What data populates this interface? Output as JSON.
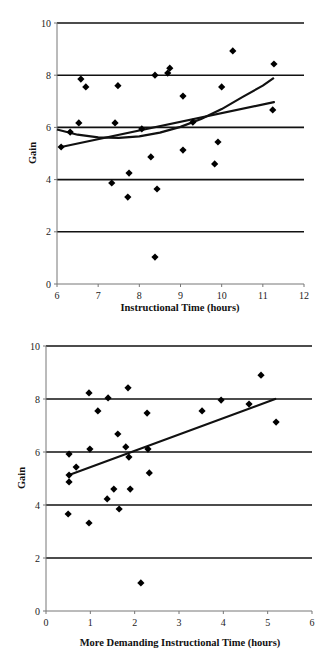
{
  "chart_data": [
    {
      "type": "scatter",
      "title": "",
      "xlabel": "Instructional Time (hours)",
      "ylabel": "Gain",
      "xlim": [
        6,
        12
      ],
      "ylim": [
        0,
        10
      ],
      "xticks": [
        6,
        7,
        8,
        9,
        10,
        11,
        12
      ],
      "yticks": [
        0,
        2,
        4,
        6,
        8,
        10
      ],
      "grid": "horizontal",
      "legend": "none",
      "marker": "diamond",
      "points": [
        {
          "x": 6.1,
          "y": 5.25
        },
        {
          "x": 6.32,
          "y": 5.82
        },
        {
          "x": 6.53,
          "y": 6.17
        },
        {
          "x": 6.58,
          "y": 7.85
        },
        {
          "x": 6.7,
          "y": 7.55
        },
        {
          "x": 7.33,
          "y": 3.87
        },
        {
          "x": 7.41,
          "y": 6.17
        },
        {
          "x": 7.48,
          "y": 7.6
        },
        {
          "x": 7.72,
          "y": 3.33
        },
        {
          "x": 7.75,
          "y": 4.25
        },
        {
          "x": 8.06,
          "y": 5.94
        },
        {
          "x": 8.28,
          "y": 4.87
        },
        {
          "x": 8.38,
          "y": 8.0
        },
        {
          "x": 8.38,
          "y": 1.03
        },
        {
          "x": 8.43,
          "y": 3.64
        },
        {
          "x": 8.69,
          "y": 8.08
        },
        {
          "x": 8.74,
          "y": 8.27
        },
        {
          "x": 9.06,
          "y": 7.2
        },
        {
          "x": 9.06,
          "y": 5.13
        },
        {
          "x": 9.3,
          "y": 6.2
        },
        {
          "x": 9.83,
          "y": 4.6
        },
        {
          "x": 9.91,
          "y": 5.44
        },
        {
          "x": 10.0,
          "y": 7.55
        },
        {
          "x": 10.27,
          "y": 8.93
        },
        {
          "x": 11.24,
          "y": 6.67
        },
        {
          "x": 11.27,
          "y": 8.43
        }
      ],
      "trendlines": [
        {
          "name": "linear",
          "type": "linear",
          "from": [
            6.1,
            5.25
          ],
          "to": [
            11.27,
            6.97
          ]
        },
        {
          "name": "quadratic",
          "type": "polynomial",
          "points": [
            [
              6.0,
              5.92
            ],
            [
              6.5,
              5.72
            ],
            [
              7.0,
              5.62
            ],
            [
              7.5,
              5.6
            ],
            [
              8.0,
              5.66
            ],
            [
              8.5,
              5.8
            ],
            [
              9.0,
              6.02
            ],
            [
              9.5,
              6.32
            ],
            [
              10.0,
              6.7
            ],
            [
              10.5,
              7.16
            ],
            [
              11.0,
              7.6
            ],
            [
              11.27,
              7.9
            ]
          ]
        }
      ]
    },
    {
      "type": "scatter",
      "title": "",
      "xlabel": "More Demanding Instructional Time (hours)",
      "ylabel": "Gain",
      "xlim": [
        0,
        6
      ],
      "ylim": [
        0,
        10
      ],
      "xticks": [
        0,
        1,
        2,
        3,
        4,
        5,
        6
      ],
      "yticks": [
        0,
        2,
        4,
        6,
        8,
        10
      ],
      "grid": "horizontal",
      "legend": "none",
      "marker": "diamond",
      "points": [
        {
          "x": 0.5,
          "y": 3.66
        },
        {
          "x": 0.52,
          "y": 5.92
        },
        {
          "x": 0.52,
          "y": 5.13
        },
        {
          "x": 0.52,
          "y": 4.87
        },
        {
          "x": 0.68,
          "y": 5.43
        },
        {
          "x": 0.97,
          "y": 8.23
        },
        {
          "x": 0.97,
          "y": 3.32
        },
        {
          "x": 0.99,
          "y": 6.11
        },
        {
          "x": 1.17,
          "y": 7.55
        },
        {
          "x": 1.38,
          "y": 4.23
        },
        {
          "x": 1.4,
          "y": 8.04
        },
        {
          "x": 1.53,
          "y": 4.6
        },
        {
          "x": 1.62,
          "y": 6.68
        },
        {
          "x": 1.65,
          "y": 3.85
        },
        {
          "x": 1.8,
          "y": 6.19
        },
        {
          "x": 1.85,
          "y": 8.42
        },
        {
          "x": 1.87,
          "y": 5.81
        },
        {
          "x": 1.9,
          "y": 4.6
        },
        {
          "x": 2.14,
          "y": 1.06
        },
        {
          "x": 2.28,
          "y": 7.47
        },
        {
          "x": 2.3,
          "y": 6.11
        },
        {
          "x": 2.33,
          "y": 5.21
        },
        {
          "x": 3.52,
          "y": 7.55
        },
        {
          "x": 3.95,
          "y": 7.96
        },
        {
          "x": 4.58,
          "y": 7.81
        },
        {
          "x": 4.85,
          "y": 8.9
        },
        {
          "x": 5.19,
          "y": 7.13
        }
      ],
      "trendlines": [
        {
          "name": "linear",
          "type": "linear",
          "from": [
            0.52,
            5.13
          ],
          "to": [
            5.17,
            8.0
          ]
        }
      ]
    }
  ],
  "charts": {
    "top": {
      "xlabel": "Instructional Time (hours)",
      "ylabel": "Gain"
    },
    "bottom": {
      "xlabel": "More Demanding Instructional Time (hours)",
      "ylabel": "Gain"
    }
  }
}
